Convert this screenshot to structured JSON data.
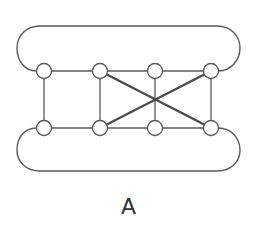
{
  "diagram": {
    "label": "A",
    "node_radius": 7.5,
    "nodes": [
      {
        "id": "t1",
        "x": 44,
        "y": 71
      },
      {
        "id": "t2",
        "x": 100,
        "y": 71
      },
      {
        "id": "t3",
        "x": 155,
        "y": 71
      },
      {
        "id": "t4",
        "x": 211,
        "y": 71
      },
      {
        "id": "b1",
        "x": 44,
        "y": 128
      },
      {
        "id": "b2",
        "x": 100,
        "y": 128
      },
      {
        "id": "b3",
        "x": 155,
        "y": 128
      },
      {
        "id": "b4",
        "x": 211,
        "y": 128
      }
    ],
    "edges": [
      {
        "from": "t1",
        "to": "t2",
        "style": "normal"
      },
      {
        "from": "t2",
        "to": "t3",
        "style": "normal"
      },
      {
        "from": "t3",
        "to": "t4",
        "style": "normal"
      },
      {
        "from": "b1",
        "to": "b2",
        "style": "normal"
      },
      {
        "from": "b2",
        "to": "b3",
        "style": "normal"
      },
      {
        "from": "b3",
        "to": "b4",
        "style": "normal"
      },
      {
        "from": "t1",
        "to": "b1",
        "style": "normal"
      },
      {
        "from": "t2",
        "to": "b2",
        "style": "normal"
      },
      {
        "from": "t3",
        "to": "b3",
        "style": "normal"
      },
      {
        "from": "t4",
        "to": "b4",
        "style": "normal"
      },
      {
        "from": "t2",
        "to": "b4",
        "style": "bold"
      },
      {
        "from": "b2",
        "to": "t4",
        "style": "bold"
      }
    ],
    "loops": [
      {
        "id": "top-loop",
        "from": "t1",
        "to": "t4",
        "side": "top"
      },
      {
        "id": "bottom-loop",
        "from": "b1",
        "to": "b4",
        "side": "bottom"
      }
    ],
    "colors": {
      "stroke": "#5a5a5a",
      "bold_stroke": "#4a4a4a",
      "node_fill": "#ffffff",
      "background": "#ffffff"
    }
  }
}
